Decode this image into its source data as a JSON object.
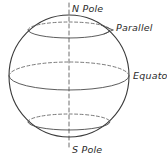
{
  "figure": {
    "background_color": "#ffffff",
    "line_color": "#3a3a3a",
    "dash_color": "#6b6b6b",
    "text_color": "#2b2b2b"
  },
  "labels": {
    "north_pole": "N Pole",
    "south_pole": "S Pole",
    "parallel": "Parallel",
    "equator": "Equator"
  },
  "geometry": {
    "sphere": {
      "center_x": 69,
      "center_y": 76,
      "radius_x": 60,
      "radius_y": 61
    },
    "axis": {
      "x": 69,
      "top_y": 3,
      "bottom_y": 150,
      "style": "dashed"
    },
    "circles": [
      {
        "name": "parallel-north",
        "center_y": 30,
        "radius_x": 41,
        "radius_y": 8,
        "back_arc": "dashed",
        "front_arc": "solid"
      },
      {
        "name": "equator",
        "center_y": 76,
        "radius_x": 60,
        "radius_y": 14,
        "back_arc": "dashed",
        "front_arc": "solid"
      },
      {
        "name": "parallel-south",
        "center_y": 122,
        "radius_x": 41,
        "radius_y": 8,
        "back_arc": "dashed",
        "front_arc": "solid"
      }
    ]
  }
}
